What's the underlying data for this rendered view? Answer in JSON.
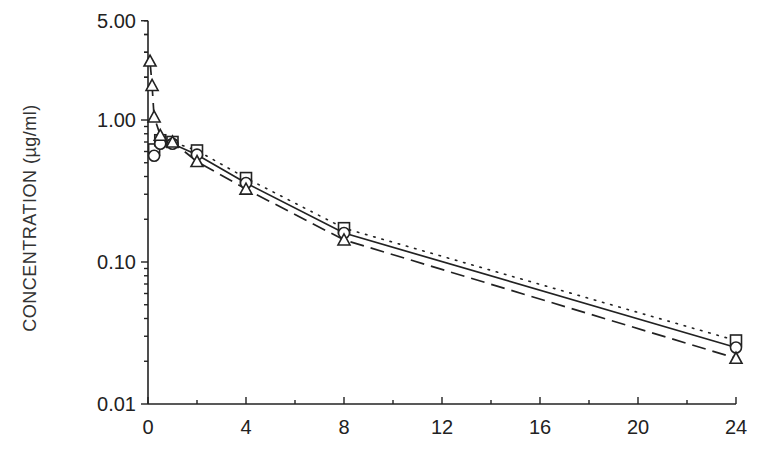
{
  "chart_data": {
    "type": "line",
    "title": "",
    "xlabel": "",
    "ylabel": "CONCENTRATION (µg/ml)",
    "yscale": "log",
    "xlim": [
      0,
      24
    ],
    "ylim": [
      0.01,
      5.0
    ],
    "x_ticks": [
      0,
      4,
      8,
      12,
      16,
      20,
      24
    ],
    "x_tick_labels": [
      "0",
      "4",
      "8",
      "12",
      "16",
      "20",
      "24"
    ],
    "y_ticks": [
      0.01,
      0.1,
      1.0,
      5.0
    ],
    "y_tick_labels": [
      "0.01",
      "0.10",
      "1.00",
      "5.00"
    ],
    "grid": false,
    "legend": null,
    "series": [
      {
        "name": "square-marker series",
        "marker": "square",
        "line_style": "dotted",
        "x": [
          0.25,
          0.5,
          1,
          2,
          4,
          8,
          24
        ],
        "values": [
          0.62,
          0.72,
          0.7,
          0.61,
          0.39,
          0.173,
          0.028
        ]
      },
      {
        "name": "circle-marker series",
        "marker": "circle",
        "line_style": "solid",
        "x": [
          0.25,
          0.5,
          1,
          2,
          4,
          8,
          24
        ],
        "values": [
          0.56,
          0.68,
          0.68,
          0.57,
          0.36,
          0.16,
          0.025
        ]
      },
      {
        "name": "triangle-marker series",
        "marker": "triangle",
        "line_style": "dashed",
        "x": [
          0.083,
          0.167,
          0.25,
          0.5,
          1,
          2,
          4,
          8,
          24
        ],
        "values": [
          2.6,
          1.75,
          1.05,
          0.78,
          0.7,
          0.51,
          0.326,
          0.143,
          0.021
        ]
      }
    ]
  },
  "axes": {
    "ylabel": "CONCENTRATION (µg/ml)",
    "x_tick_labels": [
      "0",
      "4",
      "8",
      "12",
      "16",
      "20",
      "24"
    ],
    "y_tick_labels": [
      "0.01",
      "0.10",
      "1.00",
      "5.00"
    ]
  },
  "colors": {
    "ink": "#222222",
    "background": "#ffffff"
  }
}
